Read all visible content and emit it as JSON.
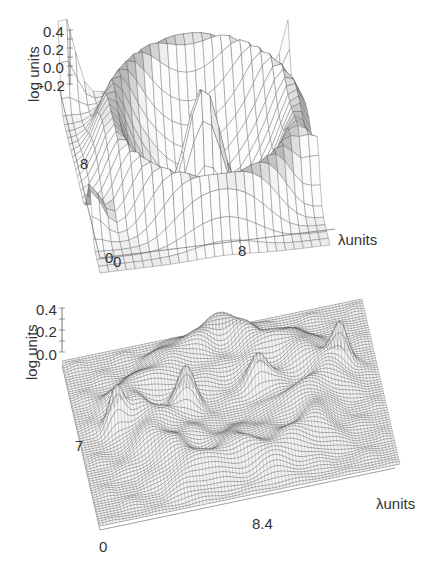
{
  "chart_data": [
    {
      "type": "surface3d",
      "title": "",
      "panel": "top",
      "zlabel": "log units",
      "xlabel": "λunits",
      "z_ticks": [
        "0.4",
        "0.2",
        "0.0",
        "-0.2"
      ],
      "zlim": [
        -0.2,
        0.4
      ],
      "x_ticks": [
        "0",
        "8"
      ],
      "y_ticks": [
        "0",
        "8"
      ],
      "description": "Smooth shaded mesh surface: central dark peak (~0.3), surrounding trough ring, raised outer annular ridge (~0.2), with corner peaks up to ~0.3 at the far corners.",
      "grid_resolution": "coarse (~24x24)",
      "shading": "grayscale facets"
    },
    {
      "type": "surface3d",
      "title": "",
      "panel": "bottom",
      "zlabel": "log units",
      "xlabel": "λunits",
      "z_ticks": [
        "0.4",
        "0.2",
        "0.0"
      ],
      "zlim": [
        0.0,
        0.4
      ],
      "x_ticks": [
        "0",
        "8.4"
      ],
      "y_ticks": [
        "7"
      ],
      "description": "Dense wireframe mesh surface: irregular annular ridge (~0.15–0.3) with several sharp peaks (~0.3–0.4), central shallow depression, flat border near 0.0.",
      "grid_resolution": "fine (~100x100)",
      "shading": "wireframe black lines"
    }
  ],
  "top": {
    "zlabel": "log units",
    "z_ticks": [
      "0.4",
      "0.2",
      "0.0",
      "-0.2"
    ],
    "y_tick_mid": "8",
    "origin_y": "0",
    "origin_x": "0",
    "x_tick_mid": "8",
    "xlabel": "λunits"
  },
  "bottom": {
    "zlabel": "log units",
    "z_ticks": [
      "0.4",
      "0.2",
      "0.0"
    ],
    "y_tick_mid": "7",
    "origin": "0",
    "x_tick_mid": "8.4",
    "xlabel": "λunits"
  }
}
